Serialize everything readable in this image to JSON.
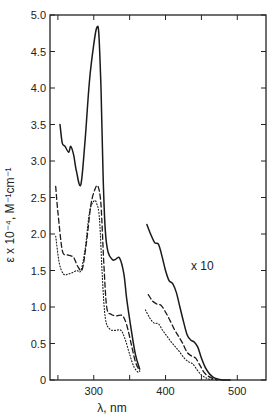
{
  "chart_data": {
    "type": "line",
    "title": "",
    "xlabel": "λ, nm",
    "ylabel": "ε x 10⁻⁴, M⁻¹cm⁻¹",
    "xlim": [
      239,
      540
    ],
    "ylim": [
      0,
      5.0
    ],
    "grid": false,
    "legend": "none",
    "x_ticks": [
      250,
      300,
      350,
      400,
      450,
      500
    ],
    "x_tick_labels": [
      "",
      "300",
      "",
      "400",
      "",
      "500"
    ],
    "y_ticks": [
      0,
      0.5,
      1.0,
      1.5,
      2.0,
      2.5,
      3.0,
      3.5,
      4.0,
      4.5,
      5.0
    ],
    "y_tick_labels": [
      "0",
      "0.5",
      "1.0",
      "1.5",
      "2.0",
      "2.5",
      "3.0",
      "3.5",
      "4.0",
      "4.5",
      "5.0"
    ],
    "annotations": [
      {
        "text": "x 10",
        "x": 436,
        "y": 1.6,
        "note": "right-hand curves scaled by 10"
      }
    ],
    "series": [
      {
        "name": "solid (UV region)",
        "style": "solid",
        "x": [
          253,
          256,
          260,
          265,
          268,
          272,
          276,
          282,
          288,
          294,
          300,
          304,
          307,
          310,
          313,
          316,
          320,
          326,
          330,
          336,
          342,
          346,
          352,
          358,
          364
        ],
        "y": [
          3.5,
          3.25,
          3.2,
          3.12,
          3.2,
          3.08,
          2.85,
          2.68,
          3.3,
          4.1,
          4.6,
          4.82,
          4.75,
          4.0,
          2.8,
          2.05,
          1.75,
          1.65,
          1.65,
          1.67,
          1.45,
          1.1,
          0.7,
          0.35,
          0.15
        ]
      },
      {
        "name": "dashed (UV region)",
        "style": "dashed",
        "x": [
          247,
          250,
          256,
          262,
          268,
          272,
          278,
          284,
          290,
          296,
          302,
          306,
          310,
          314,
          318,
          324,
          332,
          340,
          346,
          352,
          358,
          364
        ],
        "y": [
          2.65,
          2.3,
          1.78,
          1.72,
          1.7,
          1.68,
          1.55,
          1.52,
          1.9,
          2.4,
          2.62,
          2.65,
          2.4,
          1.6,
          1.0,
          0.9,
          0.88,
          0.88,
          0.75,
          0.5,
          0.25,
          0.12
        ]
      },
      {
        "name": "dotted (UV region)",
        "style": "dotted",
        "x": [
          247,
          252,
          258,
          264,
          270,
          276,
          282,
          288,
          294,
          300,
          304,
          308,
          312,
          316,
          322,
          330,
          338,
          344,
          350,
          356,
          362
        ],
        "y": [
          1.97,
          1.6,
          1.45,
          1.45,
          1.47,
          1.5,
          1.5,
          1.8,
          2.3,
          2.45,
          2.42,
          2.2,
          1.4,
          0.85,
          0.7,
          0.68,
          0.68,
          0.55,
          0.35,
          0.18,
          0.1
        ]
      },
      {
        "name": "solid x10 (visible region)",
        "style": "solid",
        "x": [
          374,
          380,
          385,
          390,
          395,
          400,
          405,
          410,
          415,
          420,
          425,
          430,
          435,
          440,
          445,
          450,
          455,
          460,
          465,
          470,
          480,
          490
        ],
        "y": [
          2.13,
          1.98,
          1.88,
          1.86,
          1.7,
          1.5,
          1.36,
          1.32,
          1.2,
          1.0,
          0.8,
          0.62,
          0.55,
          0.52,
          0.45,
          0.3,
          0.18,
          0.1,
          0.05,
          0.02,
          0.0,
          0.0
        ]
      },
      {
        "name": "dashed x10 (visible region)",
        "style": "dashed",
        "x": [
          376,
          382,
          388,
          394,
          400,
          406,
          412,
          418,
          424,
          430,
          436,
          442,
          448,
          454,
          460,
          466,
          472
        ],
        "y": [
          1.17,
          1.08,
          1.04,
          1.02,
          0.93,
          0.82,
          0.7,
          0.6,
          0.5,
          0.38,
          0.33,
          0.3,
          0.2,
          0.1,
          0.05,
          0.02,
          0.0
        ]
      },
      {
        "name": "dotted x10 (visible region)",
        "style": "dotted",
        "x": [
          372,
          378,
          384,
          390,
          396,
          402,
          408,
          414,
          420,
          426,
          432,
          438,
          444,
          450,
          456,
          462,
          468
        ],
        "y": [
          0.96,
          0.85,
          0.78,
          0.77,
          0.68,
          0.6,
          0.52,
          0.45,
          0.38,
          0.3,
          0.25,
          0.22,
          0.14,
          0.07,
          0.03,
          0.01,
          0.0
        ]
      }
    ]
  },
  "labels": {
    "xlabel": "λ, nm",
    "ylabel": "ε x 10⁻⁴, M⁻¹cm⁻¹",
    "annotation": "x 10"
  }
}
